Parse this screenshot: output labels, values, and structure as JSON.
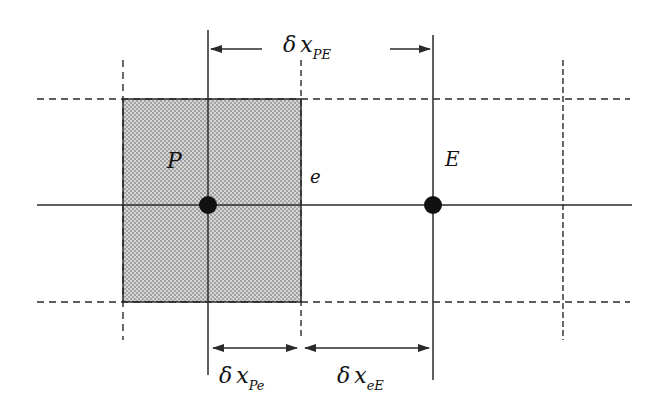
{
  "diagram": {
    "type": "finite-volume-grid",
    "nodes": [
      {
        "id": "P",
        "label": "P"
      },
      {
        "id": "E",
        "label": "E"
      }
    ],
    "face": {
      "label": "e"
    },
    "dimensions": {
      "top": {
        "symbol": "δ",
        "var": "x",
        "sub": "PE"
      },
      "bottom_left": {
        "symbol": "δ",
        "var": "x",
        "sub": "Pe"
      },
      "bottom_right": {
        "symbol": "δ",
        "var": "x",
        "sub": "eE"
      }
    },
    "colors": {
      "line": "#2a2a2a",
      "shade": "#bdbdbd",
      "node": "#111111"
    }
  }
}
